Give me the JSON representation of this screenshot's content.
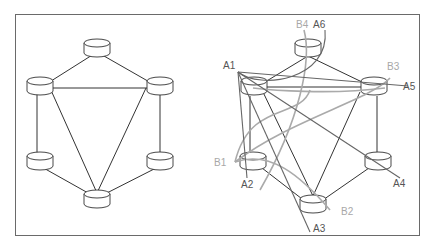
{
  "diagram": {
    "colors": {
      "frame": "#6a6a6a",
      "node_stroke": "#333333",
      "edge": "#333333",
      "path_a": "#666666",
      "path_b": "#aaaaaa",
      "label_a": "#555555",
      "label_b": "#a8a8a8"
    },
    "left": {
      "nodes": [
        {
          "id": "top",
          "x": 97,
          "y": 50
        },
        {
          "id": "top-left",
          "x": 40,
          "y": 88
        },
        {
          "id": "top-right",
          "x": 160,
          "y": 88
        },
        {
          "id": "bottom-left",
          "x": 40,
          "y": 163
        },
        {
          "id": "bottom-right",
          "x": 160,
          "y": 163
        },
        {
          "id": "bottom",
          "x": 97,
          "y": 200
        }
      ],
      "edges": [
        [
          "top",
          "top-left"
        ],
        [
          "top",
          "top-right"
        ],
        [
          "top-left",
          "top-right"
        ],
        [
          "top-left",
          "bottom-left"
        ],
        [
          "top-right",
          "bottom-right"
        ],
        [
          "bottom-left",
          "bottom"
        ],
        [
          "bottom-right",
          "bottom"
        ],
        [
          "top-left",
          "bottom"
        ],
        [
          "top-right",
          "bottom"
        ]
      ]
    },
    "right": {
      "nodes": [
        {
          "id": "top",
          "x": 308,
          "y": 50
        },
        {
          "id": "top-left",
          "x": 250,
          "y": 88
        },
        {
          "id": "top-right",
          "x": 369,
          "y": 88
        },
        {
          "id": "bottom-left",
          "x": 247,
          "y": 163
        },
        {
          "id": "bottom-right",
          "x": 369,
          "y": 163
        },
        {
          "id": "bottom",
          "x": 313,
          "y": 205
        }
      ],
      "labels": {
        "a": [
          "A1",
          "A2",
          "A3",
          "A4",
          "A5",
          "A6"
        ],
        "b": [
          "B1",
          "B2",
          "B3",
          "B4"
        ]
      }
    }
  }
}
